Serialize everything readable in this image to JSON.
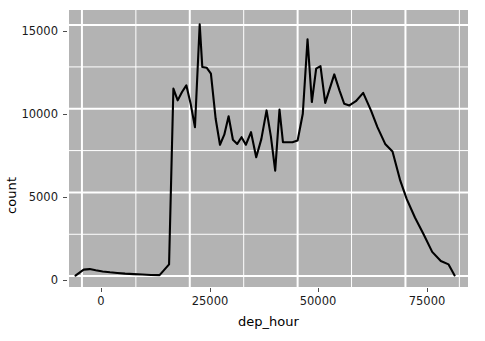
{
  "chart_data": {
    "type": "line",
    "title": "",
    "subtitle": "",
    "xlabel": "dep_hour",
    "ylabel": "count",
    "xlim": [
      -3000,
      89500
    ],
    "ylim": [
      -650,
      15900
    ],
    "xticks": [
      0,
      25000,
      50000,
      75000
    ],
    "xticklabels": [
      "0",
      "25000",
      "50000",
      "75000"
    ],
    "yticks": [
      0,
      5000,
      10000,
      15000
    ],
    "yticklabels": [
      "0",
      "5000",
      "10000",
      "15000"
    ],
    "grid": true,
    "grid_major": true,
    "grid_minor": true,
    "legend": false,
    "legend_position": "none",
    "panel_background": "#b3b3b3",
    "grid_color": "#ffffff",
    "line_color": "#000000",
    "line_width": 2.1,
    "plot_background": "#ffffff",
    "annotations": [],
    "series": [
      {
        "name": "count",
        "x": [
          -1500,
          400,
          1800,
          3200,
          4800,
          6500,
          8200,
          10000,
          12000,
          14000,
          16000,
          18000,
          20200,
          21200,
          22200,
          23200,
          24200,
          25200,
          26200,
          27300,
          27900,
          28900,
          29900,
          31000,
          32000,
          33000,
          34000,
          35000,
          36000,
          37000,
          38000,
          39200,
          40400,
          41600,
          42800,
          43800,
          44800,
          45800,
          46600,
          47600,
          48800,
          50000,
          51200,
          52300,
          53300,
          54300,
          55300,
          56400,
          57500,
          58500,
          59700,
          60800,
          62000,
          63500,
          65200,
          67000,
          68500,
          70300,
          72000,
          73800,
          75300,
          77200,
          79200,
          81200,
          83200,
          85000,
          86400
        ],
        "y": [
          30,
          390,
          420,
          350,
          280,
          230,
          190,
          150,
          120,
          95,
          70,
          60,
          700,
          11200,
          10500,
          11000,
          11400,
          10300,
          8900,
          15050,
          12500,
          12450,
          12100,
          9400,
          7850,
          8450,
          9550,
          8150,
          7900,
          8300,
          7850,
          8600,
          7100,
          8200,
          9900,
          8350,
          6300,
          9950,
          8000,
          8000,
          8000,
          8100,
          9700,
          14150,
          10400,
          12400,
          12550,
          10350,
          11250,
          12050,
          11100,
          10300,
          10200,
          10450,
          10950,
          9900,
          8900,
          7900,
          7450,
          5700,
          4600,
          3500,
          2500,
          1450,
          900,
          700,
          40
        ]
      }
    ]
  },
  "axes": {
    "y_title": "count",
    "x_title": "dep_hour",
    "y_tick_labels": [
      "15000",
      "10000",
      "5000",
      "0"
    ],
    "x_tick_labels": [
      "0",
      "25000",
      "50000",
      "75000"
    ]
  }
}
